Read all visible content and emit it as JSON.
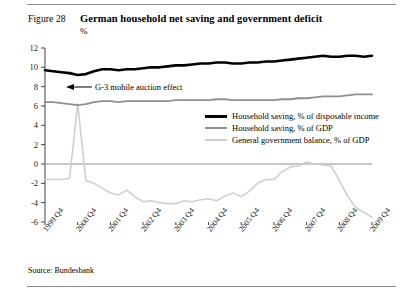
{
  "figure": {
    "label": "Figure 28",
    "title": "German household net saving and government deficit",
    "unit": "%",
    "source": "Source: Bundesbank"
  },
  "annotation": {
    "text": "G-3 mobile auction effect",
    "arrow_icon": "left-arrow-icon"
  },
  "legend": {
    "entries": [
      {
        "label": "Household saving, % of disposable income",
        "color": "#000000"
      },
      {
        "label": "Household saving, % of GDP",
        "color": "#8f8f8f"
      },
      {
        "label": "General government balance, % of GDP",
        "color": "#cfcfcf"
      }
    ]
  },
  "chart_data": {
    "type": "line",
    "title": "German household net saving and government deficit",
    "subtitle": "%",
    "xlabel": "",
    "ylabel": "%",
    "ylim": [
      -6,
      12
    ],
    "yticks": [
      12,
      10,
      8,
      6,
      4,
      2,
      0,
      -2,
      -4,
      -6
    ],
    "ytick_labels": [
      "12",
      "10",
      "8",
      "6",
      "4",
      "2",
      "0",
      "-2",
      "-4",
      "-6"
    ],
    "grid": false,
    "zero_line": true,
    "legend_position": "center-right",
    "annotations": [
      {
        "text": "G-3 mobile auction effect",
        "points_to_series": "General government balance, % of GDP",
        "points_to_x": "2000 Q4"
      }
    ],
    "xtick_labels": [
      "1999 Q4",
      "2000 Q4",
      "2001 Q4",
      "2002 Q4",
      "2003 Q4",
      "2004 Q4",
      "2005 Q4",
      "2006 Q4",
      "2007 Q4",
      "2008 Q4",
      "2009 Q4"
    ],
    "x": [
      "1999 Q4",
      "2000 Q1",
      "2000 Q2",
      "2000 Q3",
      "2000 Q4",
      "2001 Q1",
      "2001 Q2",
      "2001 Q3",
      "2001 Q4",
      "2002 Q1",
      "2002 Q2",
      "2002 Q3",
      "2002 Q4",
      "2003 Q1",
      "2003 Q2",
      "2003 Q3",
      "2003 Q4",
      "2004 Q1",
      "2004 Q2",
      "2004 Q3",
      "2004 Q4",
      "2005 Q1",
      "2005 Q2",
      "2005 Q3",
      "2005 Q4",
      "2006 Q1",
      "2006 Q2",
      "2006 Q3",
      "2006 Q4",
      "2007 Q1",
      "2007 Q2",
      "2007 Q3",
      "2007 Q4",
      "2008 Q1",
      "2008 Q2",
      "2008 Q3",
      "2008 Q4",
      "2009 Q1",
      "2009 Q2",
      "2009 Q3",
      "2009 Q4"
    ],
    "series": [
      {
        "name": "Household saving, % of disposable income",
        "color": "#000000",
        "width": 2.6,
        "values": [
          9.7,
          9.6,
          9.5,
          9.4,
          9.2,
          9.3,
          9.6,
          9.8,
          9.8,
          9.7,
          9.8,
          9.8,
          9.9,
          10.0,
          10.0,
          10.1,
          10.2,
          10.2,
          10.3,
          10.4,
          10.4,
          10.5,
          10.5,
          10.4,
          10.4,
          10.5,
          10.5,
          10.6,
          10.6,
          10.7,
          10.8,
          10.9,
          11.0,
          11.1,
          11.2,
          11.1,
          11.1,
          11.2,
          11.2,
          11.1,
          11.2
        ]
      },
      {
        "name": "Household saving, % of GDP",
        "color": "#8f8f8f",
        "width": 1.8,
        "values": [
          6.4,
          6.4,
          6.3,
          6.2,
          6.1,
          6.2,
          6.4,
          6.5,
          6.5,
          6.4,
          6.5,
          6.5,
          6.5,
          6.5,
          6.5,
          6.5,
          6.6,
          6.6,
          6.6,
          6.6,
          6.6,
          6.7,
          6.7,
          6.6,
          6.6,
          6.6,
          6.6,
          6.6,
          6.6,
          6.7,
          6.7,
          6.8,
          6.8,
          6.9,
          7.0,
          7.0,
          7.0,
          7.1,
          7.2,
          7.2,
          7.2
        ]
      },
      {
        "name": "General government balance, % of GDP",
        "color": "#cfcfcf",
        "width": 1.6,
        "values": [
          -1.6,
          -1.6,
          -1.6,
          -1.5,
          6.2,
          -1.7,
          -2.0,
          -2.5,
          -3.0,
          -3.2,
          -2.7,
          -3.4,
          -3.9,
          -3.8,
          -4.0,
          -4.1,
          -4.1,
          -3.8,
          -3.9,
          -3.7,
          -3.6,
          -3.8,
          -3.3,
          -3.0,
          -3.4,
          -2.8,
          -2.0,
          -1.6,
          -1.6,
          -0.8,
          -0.3,
          -0.2,
          0.2,
          0.0,
          -0.1,
          -0.2,
          -1.7,
          -3.3,
          -4.5,
          -5.0,
          -5.5
        ]
      }
    ]
  }
}
